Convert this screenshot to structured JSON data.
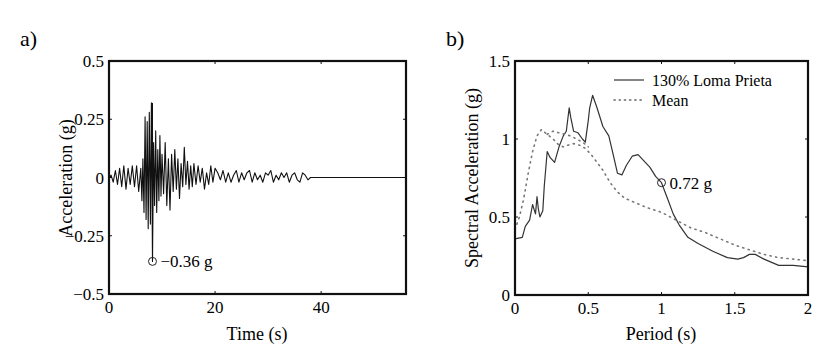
{
  "chart_data": [
    {
      "id": "a",
      "panel_label": "a)",
      "type": "line",
      "title": "",
      "xlabel": "Time (s)",
      "ylabel": "Acceleration (g)",
      "xlim": [
        0,
        56
      ],
      "ylim": [
        -0.5,
        0.5
      ],
      "xticks": [
        0,
        20,
        40
      ],
      "xtick_labels": [
        "0",
        "20",
        "40"
      ],
      "yticks": [
        -0.5,
        -0.25,
        0,
        0.25,
        0.5
      ],
      "ytick_labels": [
        "−0.5",
        "−0.25",
        "0",
        "0.25",
        "0.5"
      ],
      "grid": false,
      "series": [
        {
          "name": "Acceleration time history",
          "style": "solid",
          "x": [
            0.0,
            0.4,
            0.8,
            1.2,
            1.6,
            2.0,
            2.4,
            2.8,
            3.2,
            3.6,
            4.0,
            4.4,
            4.8,
            5.2,
            5.6,
            6.0,
            6.2,
            6.4,
            6.6,
            6.8,
            7.0,
            7.2,
            7.4,
            7.6,
            7.8,
            8.0,
            8.2,
            8.4,
            8.6,
            8.8,
            9.0,
            9.2,
            9.4,
            9.6,
            9.8,
            10.0,
            10.3,
            10.6,
            10.9,
            11.2,
            11.5,
            11.8,
            12.1,
            12.4,
            12.7,
            13.0,
            13.3,
            13.6,
            13.9,
            14.2,
            14.5,
            14.8,
            15.1,
            15.4,
            15.7,
            16.0,
            16.4,
            16.8,
            17.2,
            17.6,
            18.0,
            18.4,
            18.8,
            19.2,
            19.6,
            20.0,
            20.5,
            21.0,
            21.5,
            22.0,
            22.5,
            23.0,
            23.5,
            24.0,
            24.5,
            25.0,
            25.5,
            26.0,
            26.5,
            27.0,
            27.5,
            28.0,
            28.5,
            29.0,
            29.5,
            30.0,
            30.5,
            31.0,
            31.5,
            32.0,
            32.5,
            33.0,
            33.5,
            34.0,
            34.5,
            35.0,
            35.5,
            36.0,
            36.5,
            37.0,
            37.5,
            38.0,
            38.5,
            56.0
          ],
          "y": [
            0.0,
            0.01,
            -0.02,
            0.03,
            -0.03,
            0.04,
            -0.04,
            0.05,
            -0.05,
            0.04,
            -0.03,
            0.05,
            -0.04,
            0.05,
            -0.06,
            0.04,
            -0.1,
            0.08,
            -0.15,
            0.26,
            -0.18,
            0.24,
            -0.22,
            0.28,
            -0.2,
            0.32,
            -0.36,
            0.15,
            -0.12,
            0.2,
            -0.15,
            0.12,
            -0.1,
            0.18,
            -0.08,
            0.1,
            -0.07,
            0.15,
            -0.12,
            0.08,
            -0.14,
            0.1,
            -0.06,
            0.12,
            -0.05,
            0.08,
            -0.09,
            0.06,
            -0.04,
            0.13,
            -0.03,
            0.07,
            -0.05,
            0.05,
            -0.04,
            0.06,
            -0.03,
            0.05,
            -0.02,
            0.04,
            -0.05,
            0.02,
            -0.03,
            0.05,
            -0.02,
            0.04,
            0.02,
            -0.01,
            0.03,
            -0.02,
            0.02,
            -0.02,
            0.01,
            0.03,
            -0.02,
            0.02,
            -0.01,
            0.02,
            0.03,
            -0.02,
            0.02,
            -0.01,
            0.01,
            -0.02,
            0.02,
            0.01,
            0.03,
            -0.02,
            0.01,
            -0.01,
            0.02,
            0.0,
            0.02,
            -0.02,
            0.01,
            0.02,
            -0.01,
            -0.02,
            0.02,
            0.01,
            -0.01,
            0.0,
            0.0,
            0.0
          ]
        }
      ],
      "annotations": [
        {
          "text": "−0.36 g",
          "x": 8.2,
          "y": -0.36,
          "marker": "circle"
        }
      ]
    },
    {
      "id": "b",
      "panel_label": "b)",
      "type": "line",
      "title": "",
      "xlabel": "Period (s)",
      "ylabel": "Spectral Acceleration (g)",
      "xlim": [
        0,
        2
      ],
      "ylim": [
        0,
        1.5
      ],
      "xticks": [
        0,
        0.5,
        1,
        1.5,
        2
      ],
      "xtick_labels": [
        "0",
        "0.5",
        "1",
        "1.5",
        "2"
      ],
      "yticks": [
        0,
        0.5,
        1,
        1.5
      ],
      "ytick_labels": [
        "0",
        "0.5",
        "1",
        "1.5"
      ],
      "grid": false,
      "legend": {
        "placement": "top-right",
        "entries": [
          {
            "label": "130% Loma Prieta",
            "style": "solid"
          },
          {
            "label": "Mean",
            "style": "dotted"
          }
        ]
      },
      "series": [
        {
          "name": "130% Loma Prieta",
          "style": "solid",
          "x": [
            0.0,
            0.05,
            0.07,
            0.1,
            0.12,
            0.13,
            0.14,
            0.15,
            0.16,
            0.17,
            0.19,
            0.2,
            0.22,
            0.24,
            0.27,
            0.3,
            0.33,
            0.35,
            0.37,
            0.38,
            0.4,
            0.43,
            0.46,
            0.48,
            0.5,
            0.51,
            0.53,
            0.56,
            0.6,
            0.64,
            0.67,
            0.7,
            0.73,
            0.76,
            0.8,
            0.84,
            0.88,
            0.92,
            0.96,
            1.0,
            1.04,
            1.08,
            1.12,
            1.18,
            1.25,
            1.35,
            1.45,
            1.52,
            1.56,
            1.6,
            1.64,
            1.7,
            1.8,
            1.9,
            2.0
          ],
          "y": [
            0.36,
            0.37,
            0.44,
            0.48,
            0.58,
            0.55,
            0.52,
            0.63,
            0.55,
            0.5,
            0.54,
            0.7,
            0.92,
            0.88,
            0.85,
            0.95,
            1.02,
            1.05,
            1.2,
            1.14,
            1.05,
            1.04,
            1.0,
            0.98,
            1.12,
            1.2,
            1.28,
            1.2,
            1.08,
            1.02,
            0.9,
            0.78,
            0.77,
            0.83,
            0.89,
            0.9,
            0.86,
            0.82,
            0.76,
            0.72,
            0.62,
            0.52,
            0.45,
            0.37,
            0.33,
            0.28,
            0.24,
            0.23,
            0.24,
            0.26,
            0.26,
            0.23,
            0.19,
            0.19,
            0.18
          ]
        },
        {
          "name": "Mean",
          "style": "dotted",
          "x": [
            0.0,
            0.03,
            0.06,
            0.09,
            0.12,
            0.15,
            0.18,
            0.22,
            0.26,
            0.3,
            0.33,
            0.36,
            0.4,
            0.44,
            0.48,
            0.52,
            0.56,
            0.6,
            0.65,
            0.7,
            0.75,
            0.8,
            0.9,
            1.0,
            1.1,
            1.2,
            1.3,
            1.4,
            1.5,
            1.6,
            1.7,
            1.8,
            1.9,
            2.0
          ],
          "y": [
            0.42,
            0.5,
            0.62,
            0.78,
            0.92,
            1.02,
            1.06,
            1.03,
            1.0,
            0.96,
            0.95,
            0.96,
            0.97,
            0.96,
            0.94,
            0.9,
            0.85,
            0.8,
            0.72,
            0.66,
            0.62,
            0.6,
            0.56,
            0.53,
            0.48,
            0.43,
            0.4,
            0.36,
            0.32,
            0.29,
            0.26,
            0.24,
            0.23,
            0.22
          ]
        },
        {
          "name": "Mean (upper branch)",
          "style": "dotted",
          "x": [
            0.22,
            0.26,
            0.3,
            0.34,
            0.38,
            0.42,
            0.46,
            0.5
          ],
          "y": [
            1.03,
            1.05,
            1.04,
            1.03,
            1.02,
            1.0,
            0.98,
            0.95
          ]
        }
      ],
      "annotations": [
        {
          "text": "0.72 g",
          "x": 1.0,
          "y": 0.72,
          "marker": "circle"
        }
      ]
    }
  ]
}
